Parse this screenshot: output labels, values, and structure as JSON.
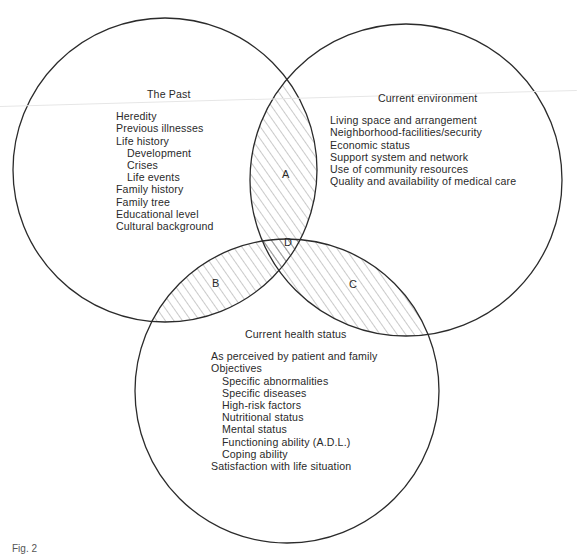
{
  "diagram": {
    "type": "venn",
    "sets": [
      {
        "id": "past",
        "title": "The Past",
        "items": [
          {
            "text": "Heredity",
            "level": 0
          },
          {
            "text": "Previous illnesses",
            "level": 0
          },
          {
            "text": "Life history",
            "level": 0
          },
          {
            "text": "Development",
            "level": 1
          },
          {
            "text": "Crises",
            "level": 1
          },
          {
            "text": "Life events",
            "level": 1
          },
          {
            "text": "Family history",
            "level": 0
          },
          {
            "text": "Family tree",
            "level": 0
          },
          {
            "text": "Educational level",
            "level": 0
          },
          {
            "text": "Cultural background",
            "level": 0
          }
        ]
      },
      {
        "id": "environment",
        "title": "Current environment",
        "items": [
          {
            "text": "Living space and arrangement",
            "level": 0
          },
          {
            "text": "Neighborhood-facilities/security",
            "level": 0
          },
          {
            "text": "Economic status",
            "level": 0
          },
          {
            "text": "Support system and network",
            "level": 0
          },
          {
            "text": "Use of community resources",
            "level": 0
          },
          {
            "text": "Quality and availability of medical care",
            "level": 0
          }
        ]
      },
      {
        "id": "health",
        "title": "Current health status",
        "items": [
          {
            "text": "As perceived by patient and family",
            "level": 0
          },
          {
            "text": "Objectives",
            "level": 0
          },
          {
            "text": "Specific abnormalities",
            "level": 1
          },
          {
            "text": "Specific diseases",
            "level": 1
          },
          {
            "text": "High-risk factors",
            "level": 1
          },
          {
            "text": "Nutritional status",
            "level": 1
          },
          {
            "text": "Mental status",
            "level": 1
          },
          {
            "text": "Functioning ability (A.D.L.)",
            "level": 1
          },
          {
            "text": "Coping ability",
            "level": 1
          },
          {
            "text": "Satisfaction with life situation",
            "level": 0
          }
        ]
      }
    ],
    "intersections": [
      {
        "label": "A",
        "sets": [
          "past",
          "environment"
        ]
      },
      {
        "label": "B",
        "sets": [
          "past",
          "health"
        ]
      },
      {
        "label": "C",
        "sets": [
          "environment",
          "health"
        ]
      },
      {
        "label": "D",
        "sets": [
          "past",
          "environment",
          "health"
        ]
      }
    ],
    "colors": {
      "outline": "#2b2b2b",
      "hatch": "#8a8a8a",
      "text": "#2a2a2a"
    }
  },
  "caption": "Fig. 2"
}
